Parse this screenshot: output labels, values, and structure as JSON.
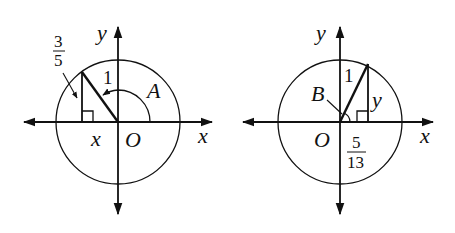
{
  "figures": [
    {
      "id": "left",
      "axis_x_label": "x",
      "axis_y_label": "y",
      "origin_label": "O",
      "angle_label": "A",
      "hypotenuse_label": "1",
      "horizontal_leg_label": "x",
      "vertical_leg_fraction": {
        "numerator": "3",
        "denominator": "5"
      },
      "quadrant": "II"
    },
    {
      "id": "right",
      "axis_x_label": "x",
      "axis_y_label": "y",
      "origin_label": "O",
      "angle_label": "B",
      "hypotenuse_label": "1",
      "vertical_leg_label": "y",
      "horizontal_leg_fraction": {
        "numerator": "5",
        "denominator": "13"
      },
      "quadrant": "I"
    }
  ],
  "colors": {
    "stroke": "#111111",
    "background": "#ffffff"
  }
}
